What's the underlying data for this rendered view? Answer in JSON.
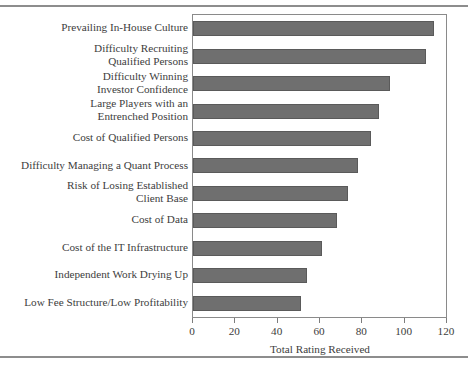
{
  "chart_data": {
    "type": "bar",
    "orientation": "horizontal",
    "title": "",
    "xlabel": "Total Rating Received",
    "ylabel": "",
    "xlim": [
      0,
      120
    ],
    "xticks": [
      0,
      20,
      40,
      60,
      80,
      100,
      120
    ],
    "grid": false,
    "legend": null,
    "bar_color": "#6f6f6f",
    "bar_edge_color": "#5a5a5a",
    "frame_color": "#8a8a8a",
    "categories": [
      "Prevailing In-House Culture",
      "Difficulty Recruiting\nQualified Persons",
      "Difficulty Winning\nInvestor Confidence",
      "Large Players with an\nEntrenched Position",
      "Cost of Qualified Persons",
      "Difficulty Managing a Quant Process",
      "Risk of Losing Established\nClient Base",
      "Cost of Data",
      "Cost of the IT Infrastructure",
      "Independent Work Drying Up",
      "Low Fee Structure/Low Profitability"
    ],
    "values": [
      114,
      110,
      93,
      88,
      84,
      78,
      73,
      68,
      61,
      54,
      51
    ]
  }
}
